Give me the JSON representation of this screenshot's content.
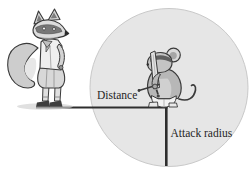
{
  "figure": {
    "labels": {
      "distance": "Distance",
      "attack_radius": "Attack radius"
    },
    "colors": {
      "background": "#ffffff",
      "circle_fill": "#e6e6e6",
      "circle_edge": "#c9c9c9",
      "line": "#2e2e2e",
      "text": "#1f1f1f",
      "illustration_outline": "#3a3a3a",
      "illustration_fill": "#cccccc"
    },
    "illustrations": {
      "left": "fox-character",
      "center": "rat-with-sword-character"
    }
  }
}
